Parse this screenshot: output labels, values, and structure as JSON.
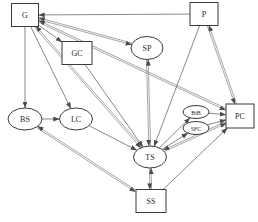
{
  "diagram": {
    "width": 258,
    "height": 222,
    "background_color": "#ffffff",
    "node_stroke_color": "#3b3b3b",
    "edge_stroke_color": "#555555",
    "label_color": "#2a2a2a",
    "nodes": [
      {
        "id": "G",
        "label": "G",
        "shape": "rectangle",
        "cx": 25,
        "cy": 15,
        "w": 27,
        "h": 23,
        "font_size": 8
      },
      {
        "id": "P",
        "label": "P",
        "shape": "rectangle",
        "cx": 204,
        "cy": 14,
        "w": 28,
        "h": 23,
        "font_size": 8
      },
      {
        "id": "GC",
        "label": "GC",
        "shape": "rectangle",
        "cx": 77,
        "cy": 53,
        "w": 30,
        "h": 23,
        "font_size": 8
      },
      {
        "id": "SP",
        "label": "SP",
        "shape": "ellipse",
        "cx": 147,
        "cy": 48,
        "w": 32,
        "h": 23,
        "font_size": 8
      },
      {
        "id": "BS",
        "label": "BS",
        "shape": "ellipse",
        "cx": 25,
        "cy": 119,
        "w": 34,
        "h": 22,
        "font_size": 8
      },
      {
        "id": "LC",
        "label": "LC",
        "shape": "ellipse",
        "cx": 76,
        "cy": 119,
        "w": 33,
        "h": 22,
        "font_size": 8
      },
      {
        "id": "BtB",
        "label": "BtB",
        "shape": "ellipse",
        "cx": 196,
        "cy": 112,
        "w": 26,
        "h": 13,
        "font_size": 6
      },
      {
        "id": "SFC",
        "label": "SFC",
        "shape": "ellipse",
        "cx": 196,
        "cy": 128,
        "w": 26,
        "h": 13,
        "font_size": 6
      },
      {
        "id": "PC",
        "label": "PC",
        "shape": "rectangle",
        "cx": 240,
        "cy": 116,
        "w": 28,
        "h": 24,
        "font_size": 8
      },
      {
        "id": "TS",
        "label": "TS",
        "shape": "ellipse",
        "cx": 150,
        "cy": 157,
        "w": 33,
        "h": 22,
        "font_size": 8
      },
      {
        "id": "SS",
        "label": "SS",
        "shape": "rectangle",
        "cx": 151,
        "cy": 201,
        "w": 30,
        "h": 23,
        "font_size": 8
      }
    ],
    "edges": [
      {
        "from": "P",
        "to": "G",
        "direction": "one-way"
      },
      {
        "from": "G",
        "to": "SP",
        "direction": "two-way"
      },
      {
        "from": "G",
        "to": "GC",
        "direction": "one-way"
      },
      {
        "from": "G",
        "to": "PC",
        "direction": "two-way"
      },
      {
        "from": "G",
        "to": "BS",
        "direction": "one-way"
      },
      {
        "from": "G",
        "to": "LC",
        "direction": "one-way"
      },
      {
        "from": "G",
        "to": "TS",
        "direction": "two-way"
      },
      {
        "from": "GC",
        "to": "TS",
        "direction": "one-way"
      },
      {
        "from": "SP",
        "to": "TS",
        "direction": "two-way"
      },
      {
        "from": "P",
        "to": "TS",
        "direction": "one-way"
      },
      {
        "from": "P",
        "to": "PC",
        "direction": "two-way"
      },
      {
        "from": "BS",
        "to": "LC",
        "direction": "one-way"
      },
      {
        "from": "LC",
        "to": "TS",
        "direction": "one-way"
      },
      {
        "from": "BS",
        "to": "SS",
        "direction": "two-way"
      },
      {
        "from": "TS",
        "to": "SS",
        "direction": "two-way"
      },
      {
        "from": "TS",
        "to": "BtB",
        "direction": "one-way"
      },
      {
        "from": "TS",
        "to": "SFC",
        "direction": "one-way"
      },
      {
        "from": "BtB",
        "to": "PC",
        "direction": "one-way"
      },
      {
        "from": "SFC",
        "to": "PC",
        "direction": "one-way"
      },
      {
        "from": "TS",
        "to": "PC",
        "direction": "two-way"
      },
      {
        "from": "SS",
        "to": "PC",
        "direction": "one-way"
      }
    ]
  }
}
